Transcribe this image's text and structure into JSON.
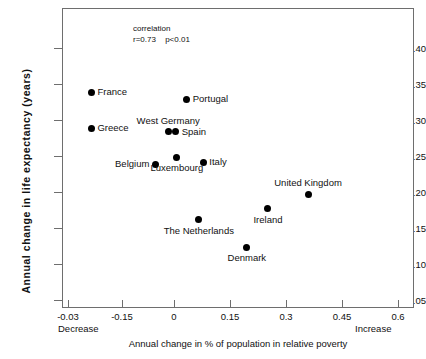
{
  "chart_data": {
    "type": "scatter",
    "title": "",
    "xlabel": "Annual change in % of population in relative poverty",
    "ylabel": "Annual change in life expectancy (years)",
    "xlim": [
      -0.03,
      0.6
    ],
    "ylim": [
      0.05,
      0.425
    ],
    "grid": false,
    "legend": "none",
    "x_ticks": [
      "-0.03",
      "-0.15",
      "0",
      "0.15",
      "0.3",
      "0.45",
      "0.6"
    ],
    "x_tick_values": [
      -0.03,
      -0.15,
      0,
      0.15,
      0.3,
      0.45,
      0.6
    ],
    "y_ticks": [
      "0.05",
      "0.10",
      "0.15",
      "0.20",
      "0.25",
      "0.30",
      "0.35",
      "0.40"
    ],
    "y_tick_values": [
      0.05,
      0.1,
      0.15,
      0.2,
      0.25,
      0.3,
      0.35,
      0.4
    ],
    "x_axis_start_label": "Decrease",
    "x_axis_end_label": "Increase",
    "annotation": {
      "line1": "correlation",
      "r": "r=0.73",
      "p": "p<0.01"
    },
    "points": [
      {
        "label": "France",
        "x": -0.221,
        "y": 0.34,
        "label_pos": "right"
      },
      {
        "label": "Greece",
        "x": -0.221,
        "y": 0.29,
        "label_pos": "right"
      },
      {
        "label": "Portugal",
        "x": 0.031,
        "y": 0.33,
        "label_pos": "right"
      },
      {
        "label": "West Germany",
        "x": -0.018,
        "y": 0.285,
        "label_pos": "above"
      },
      {
        "label": "Spain",
        "x": 0.002,
        "y": 0.285,
        "label_pos": "right"
      },
      {
        "label": "Belgium",
        "x": -0.052,
        "y": 0.24,
        "label_pos": "left"
      },
      {
        "label": "Luxembourg",
        "x": 0.005,
        "y": 0.25,
        "label_pos": "below"
      },
      {
        "label": "Italy",
        "x": 0.075,
        "y": 0.243,
        "label_pos": "right"
      },
      {
        "label": "The Netherlands",
        "x": 0.063,
        "y": 0.163,
        "label_pos": "below"
      },
      {
        "label": "Denmark",
        "x": 0.19,
        "y": 0.125,
        "label_pos": "below"
      },
      {
        "label": "Ireland",
        "x": 0.246,
        "y": 0.178,
        "label_pos": "below"
      },
      {
        "label": "United Kingdom",
        "x": 0.352,
        "y": 0.198,
        "label_pos": "above"
      }
    ]
  },
  "colors": {
    "point": "#000000",
    "axis": "#6e6e6e",
    "text": "#111111",
    "background": "#ffffff"
  }
}
